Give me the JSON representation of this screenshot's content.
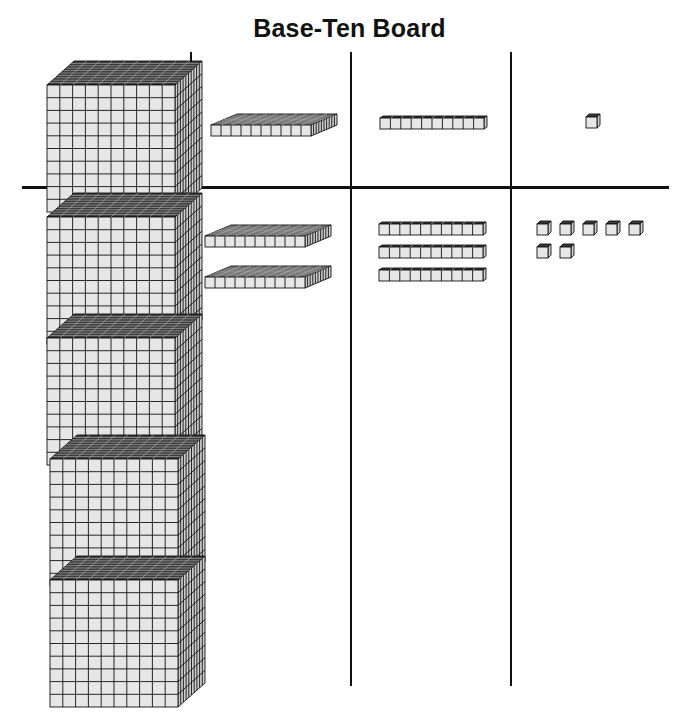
{
  "title": "Base-Ten Board",
  "board": {
    "columns": [
      "thousands-cube",
      "hundreds-flat",
      "tens-rod",
      "ones-unit"
    ],
    "key_row": {
      "cubes": 1,
      "flats": 1,
      "rods": 1,
      "units": 1
    },
    "work_row": {
      "cubes": 4,
      "flats": 2,
      "rods": 3,
      "units": 7
    }
  },
  "colors": {
    "line": "#111111",
    "face": "#e6e6e6",
    "top": "#3a3a3a",
    "side": "#cfcfcf"
  }
}
